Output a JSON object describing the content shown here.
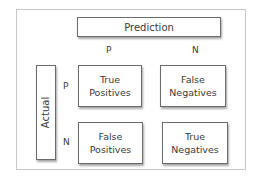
{
  "diagram": {
    "prediction_label": "Prediction",
    "actual_label": "Actual",
    "columns": [
      "P",
      "N"
    ],
    "rows": [
      "P",
      "N"
    ],
    "cells": {
      "tp": {
        "line1": "True",
        "line2": "Positives"
      },
      "fn": {
        "line1": "False",
        "line2": "Negatives"
      },
      "fp": {
        "line1": "False",
        "line2": "Positives"
      },
      "tn": {
        "line1": "True",
        "line2": "Negatives"
      }
    }
  }
}
